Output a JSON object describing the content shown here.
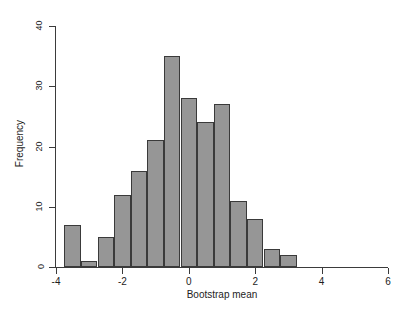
{
  "chart_data": {
    "type": "bar",
    "title": "",
    "xlabel": "Bootstrap mean",
    "ylabel": "Frequency",
    "xlim": [
      -4,
      6
    ],
    "ylim": [
      0,
      40
    ],
    "xticks": [
      -4,
      -2,
      0,
      2,
      4,
      6
    ],
    "xtick_labels": [
      "-4",
      "-2",
      "0",
      "2",
      "4",
      "6"
    ],
    "yticks": [
      0,
      10,
      20,
      30,
      40
    ],
    "ytick_labels": [
      "0",
      "10",
      "20",
      "30",
      "40"
    ],
    "grid": false,
    "legend": null,
    "bin_width": 0.5,
    "bin_starts": [
      -3.75,
      -3.25,
      -2.75,
      -2.25,
      -1.75,
      -1.25,
      -0.75,
      -0.25,
      0.25,
      0.75,
      1.25,
      1.75,
      2.25,
      2.75
    ],
    "bin_ends": [
      -3.25,
      -2.75,
      -2.25,
      -1.75,
      -1.25,
      -0.75,
      -0.25,
      0.25,
      0.75,
      1.25,
      1.75,
      2.25,
      2.75,
      3.25
    ],
    "categories": [
      "-3.75",
      "-3.25",
      "-2.75",
      "-2.25",
      "-1.75",
      "-1.25",
      "-0.75",
      "-0.25",
      "0.25",
      "0.75",
      "1.25",
      "1.75",
      "2.25",
      "2.75"
    ],
    "values": [
      7,
      1,
      5,
      12,
      16,
      21,
      35,
      28,
      24,
      27,
      11,
      8,
      3,
      2
    ],
    "bar_color": "#969696",
    "bar_edge_color": "#3a3a3a",
    "axis_color": "#3b3b3b",
    "background": "#ffffff"
  },
  "bars": [
    {
      "label": "bin--3.75",
      "x0": -3.75,
      "x1": -3.25,
      "value": 7
    },
    {
      "label": "bin--3.25",
      "x0": -3.25,
      "x1": -2.75,
      "value": 1
    },
    {
      "label": "bin--2.75",
      "x0": -2.75,
      "x1": -2.25,
      "value": 5
    },
    {
      "label": "bin--2.25",
      "x0": -2.25,
      "x1": -1.75,
      "value": 12
    },
    {
      "label": "bin--1.75",
      "x0": -1.75,
      "x1": -1.25,
      "value": 16
    },
    {
      "label": "bin--1.25",
      "x0": -1.25,
      "x1": -0.75,
      "value": 21
    },
    {
      "label": "bin--0.75",
      "x0": -0.75,
      "x1": -0.25,
      "value": 35
    },
    {
      "label": "bin--0.25",
      "x0": -0.25,
      "x1": 0.25,
      "value": 28
    },
    {
      "label": "bin-0.25",
      "x0": 0.25,
      "x1": 0.75,
      "value": 24
    },
    {
      "label": "bin-0.75",
      "x0": 0.75,
      "x1": 1.25,
      "value": 27
    },
    {
      "label": "bin-1.25",
      "x0": 1.25,
      "x1": 1.75,
      "value": 11
    },
    {
      "label": "bin-1.75",
      "x0": 1.75,
      "x1": 2.25,
      "value": 8
    },
    {
      "label": "bin-2.25",
      "x0": 2.25,
      "x1": 2.75,
      "value": 3
    },
    {
      "label": "bin-2.75",
      "x0": 2.75,
      "x1": 3.25,
      "value": 2
    }
  ]
}
